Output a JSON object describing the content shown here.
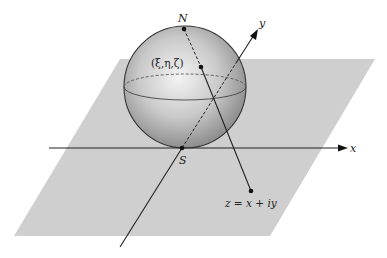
{
  "diagram": {
    "labels": {
      "north_pole": "N",
      "south_pole": "S",
      "sphere_point": "(ξ,η,ζ)",
      "x_axis": "x",
      "y_axis": "y",
      "plane_point": "z = x + iy"
    },
    "colors": {
      "plane": "#cfcfcf",
      "sphere_light": "#f2f2f2",
      "sphere_dark": "#8e8e8e",
      "lines": "#222222"
    },
    "elements": [
      "complex plane (parallelogram)",
      "Riemann sphere tangent at S",
      "x axis with arrow",
      "y axis with arrow",
      "line from N through (ξ,η,ζ) to z"
    ]
  }
}
